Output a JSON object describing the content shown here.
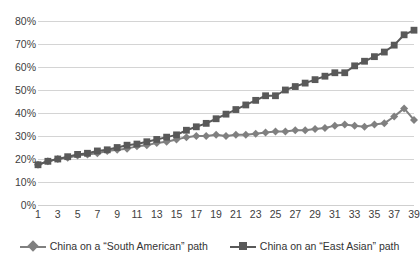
{
  "chart_data": {
    "type": "line",
    "title": "",
    "subtitle": "",
    "xlabel": "",
    "ylabel": "",
    "xlim": [
      1,
      39
    ],
    "ylim": [
      0,
      0.8
    ],
    "ytick_labels": [
      "80%",
      "70%",
      "60%",
      "50%",
      "40%",
      "30%",
      "20%",
      "10%",
      "0%"
    ],
    "ytick_values": [
      0.8,
      0.7,
      0.6,
      0.5,
      0.4,
      0.3,
      0.2,
      0.1,
      0.0
    ],
    "grid": "horizontal",
    "legend_position": "bottom-center",
    "x": [
      1,
      2,
      3,
      4,
      5,
      6,
      7,
      8,
      9,
      10,
      11,
      12,
      13,
      14,
      15,
      16,
      17,
      18,
      19,
      20,
      21,
      22,
      23,
      24,
      25,
      26,
      27,
      28,
      29,
      30,
      31,
      32,
      33,
      34,
      35,
      36,
      37,
      38,
      39
    ],
    "xtick_labels": [
      "1",
      "3",
      "5",
      "7",
      "9",
      "11",
      "13",
      "15",
      "17",
      "19",
      "21",
      "23",
      "25",
      "27",
      "29",
      "31",
      "33",
      "35",
      "37",
      "39"
    ],
    "xtick_values": [
      1,
      3,
      5,
      7,
      9,
      11,
      13,
      15,
      17,
      19,
      21,
      23,
      25,
      27,
      29,
      31,
      33,
      35,
      37,
      39
    ],
    "series": [
      {
        "name": "China on a “South American” path",
        "marker": "diamond",
        "color": "#808080",
        "values": [
          0.175,
          0.19,
          0.2,
          0.205,
          0.215,
          0.22,
          0.225,
          0.235,
          0.24,
          0.245,
          0.255,
          0.26,
          0.27,
          0.275,
          0.285,
          0.295,
          0.3,
          0.3,
          0.305,
          0.3,
          0.305,
          0.305,
          0.31,
          0.315,
          0.32,
          0.32,
          0.325,
          0.325,
          0.33,
          0.335,
          0.345,
          0.35,
          0.345,
          0.34,
          0.35,
          0.355,
          0.385,
          0.42,
          0.37
        ]
      },
      {
        "name": "China on an “East Asian” path",
        "marker": "square",
        "color": "#595959",
        "values": [
          0.175,
          0.19,
          0.2,
          0.21,
          0.22,
          0.225,
          0.235,
          0.24,
          0.25,
          0.26,
          0.265,
          0.275,
          0.285,
          0.295,
          0.305,
          0.325,
          0.34,
          0.355,
          0.375,
          0.395,
          0.415,
          0.435,
          0.455,
          0.475,
          0.475,
          0.5,
          0.515,
          0.53,
          0.545,
          0.56,
          0.575,
          0.575,
          0.605,
          0.625,
          0.645,
          0.665,
          0.695,
          0.74,
          0.76
        ]
      }
    ]
  },
  "legend": {
    "entries": [
      {
        "label": "China on a “South American” path"
      },
      {
        "label": "China on an “East Asian” path"
      }
    ]
  }
}
